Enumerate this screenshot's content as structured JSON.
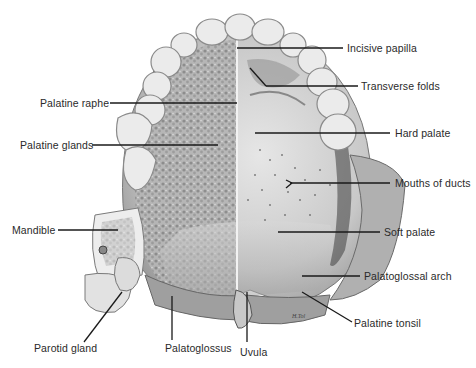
{
  "figure": {
    "signature": "H.Tol"
  },
  "labels": {
    "incisive_papilla": "Incisive papilla",
    "transverse_folds": "Transverse folds",
    "palatine_raphe": "Palatine raphe",
    "palatine_glands": "Palatine glands",
    "hard_palate": "Hard palate",
    "mouths_of_ducts": "Mouths of ducts",
    "mandible": "Mandible",
    "soft_palate": "Soft palate",
    "palatoglossal_arch": "Palatoglossal arch",
    "palatine_tonsil": "Palatine tonsil",
    "parotid_gland": "Parotid gland",
    "palatoglossus": "Palatoglossus",
    "uvula": "Uvula"
  },
  "colors": {
    "background": "#ffffff",
    "leader_line": "#1a1a1a",
    "label_text": "#2a2a2a",
    "tooth": "#e9e9e9",
    "tooth_outline": "#8a8a8a",
    "mucosa": "#cfcfcf",
    "gland_texture": "#8f8f8f",
    "shadow": "#5a5a5a"
  }
}
